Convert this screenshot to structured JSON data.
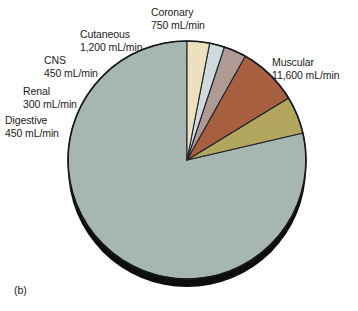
{
  "figure": {
    "panel_letter": "(b)",
    "background_color": "#ffffff"
  },
  "chart_data": {
    "type": "pie",
    "title": "",
    "subtitle": "",
    "xlabel": "",
    "ylabel": "",
    "unit": "mL/min",
    "total": 14750,
    "legend_position": "outside-labels",
    "grid": false,
    "start_angle_deg": 90,
    "direction": "counterclockwise",
    "categories": [
      "Muscular",
      "Coronary",
      "Cutaneous",
      "CNS",
      "Renal",
      "Digestive"
    ],
    "values": [
      11600,
      750,
      1200,
      450,
      300,
      450
    ],
    "value_labels": [
      "11,600 mL/min",
      "750 mL/min",
      "1,200 mL/min",
      "450 mL/min",
      "300 mL/min",
      "450 mL/min"
    ],
    "colors": [
      "#a9b8b3",
      "#b4a85f",
      "#a96040",
      "#b29b96",
      "#d2dce0",
      "#f0e3c1"
    ],
    "slices": [
      {
        "name": "Muscular",
        "label_line1": "Muscular",
        "label_line2": "11,600 mL/min",
        "value": 11600,
        "color": "#a9b8b3"
      },
      {
        "name": "Coronary",
        "label_line1": "Coronary",
        "label_line2": "750 mL/min",
        "value": 750,
        "color": "#b4a85f"
      },
      {
        "name": "Cutaneous",
        "label_line1": "Cutaneous",
        "label_line2": "1,200 mL/min",
        "value": 1200,
        "color": "#a96040"
      },
      {
        "name": "CNS",
        "label_line1": "CNS",
        "label_line2": "450 mL/min",
        "value": 450,
        "color": "#b29b96"
      },
      {
        "name": "Renal",
        "label_line1": "Renal",
        "label_line2": "300 mL/min",
        "value": 300,
        "color": "#d2dce0"
      },
      {
        "name": "Digestive",
        "label_line1": "Digestive",
        "label_line2": "450 mL/min",
        "value": 450,
        "color": "#f0e3c1"
      }
    ]
  }
}
